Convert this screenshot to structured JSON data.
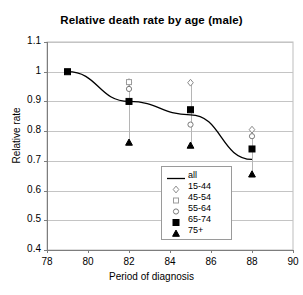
{
  "chart_data": {
    "type": "line",
    "title": "Relative death rate by age (male)",
    "xlabel": "Period of diagnosis",
    "ylabel": "Relative rate",
    "xlim": [
      78,
      90
    ],
    "ylim": [
      0.4,
      1.1
    ],
    "xticks": [
      78,
      80,
      82,
      84,
      86,
      88,
      90
    ],
    "yticks": [
      0.4,
      0.5,
      0.6,
      0.7,
      0.8,
      0.9,
      1.0,
      1.1
    ],
    "ytick_labels": [
      "0.4",
      "0.5",
      "0.6",
      "0.7",
      "0.8",
      "0.9",
      "1",
      "1.1"
    ],
    "xtick_labels": [
      "78",
      "80",
      "82",
      "84",
      "86",
      "88",
      "90"
    ],
    "grid": "horizontal",
    "legend_position": "inside-lower-right",
    "series": [
      {
        "name": "all",
        "marker": "line",
        "marker_style": "none",
        "color": "#000000",
        "x": [
          79,
          82,
          85,
          88
        ],
        "values": [
          1.0,
          0.9,
          0.855,
          0.705
        ]
      },
      {
        "name": "15-44",
        "marker": "open-diamond",
        "marker_style": "open",
        "color": "#000000",
        "x": [
          82,
          85,
          88
        ],
        "values": [
          0.965,
          0.963,
          0.805
        ]
      },
      {
        "name": "45-54",
        "marker": "open-square",
        "marker_style": "open",
        "color": "#000000",
        "x": [
          82
        ],
        "values": [
          0.965
        ]
      },
      {
        "name": "55-64",
        "marker": "open-circle",
        "marker_style": "open",
        "color": "#000000",
        "x": [
          82,
          85,
          88
        ],
        "values": [
          0.942,
          0.822,
          0.783
        ]
      },
      {
        "name": "65-74",
        "marker": "filled-square",
        "marker_style": "filled",
        "color": "#000000",
        "x": [
          79,
          82,
          85,
          88
        ],
        "values": [
          1.0,
          0.9,
          0.872,
          0.74
        ]
      },
      {
        "name": "75+",
        "marker": "filled-triangle",
        "marker_style": "filled",
        "color": "#000000",
        "x": [
          82,
          85,
          88
        ],
        "values": [
          0.762,
          0.752,
          0.655
        ]
      }
    ],
    "error_bars": [
      {
        "x": 82,
        "low": 0.762,
        "high": 0.975
      },
      {
        "x": 85,
        "low": 0.752,
        "high": 0.965
      },
      {
        "x": 88,
        "low": 0.655,
        "high": 0.81
      }
    ]
  },
  "legend": {
    "items": [
      {
        "label": "all",
        "marker": "line-swatch"
      },
      {
        "label": "15-44",
        "marker": "open-diamond"
      },
      {
        "label": "45-54",
        "marker": "open-square"
      },
      {
        "label": "55-64",
        "marker": "open-circle"
      },
      {
        "label": "65-74",
        "marker": "filled-square"
      },
      {
        "label": "75+",
        "marker": "filled-triangle"
      }
    ]
  }
}
